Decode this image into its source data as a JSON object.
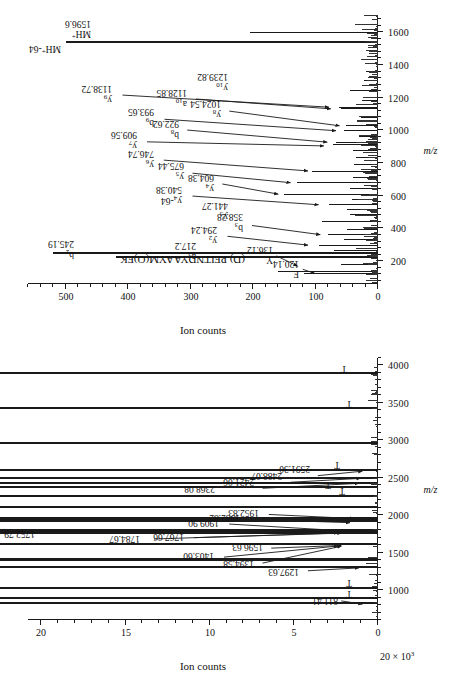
{
  "figure": {
    "orientation": "rotated-90-ccw",
    "panel_count": 2
  },
  "panel_a": {
    "title": "",
    "axes": {
      "x_title": "m/z",
      "x_ticks": [
        1000,
        1500,
        2000,
        2500,
        3000,
        3500,
        4000
      ],
      "x_min": 600,
      "x_max": 4100,
      "y_title": "Ion counts",
      "y_exponent_label": "20 × 10",
      "y_exponent_sup": "3",
      "y_ticks": [
        0,
        5,
        10,
        15,
        20
      ],
      "y_min": 0,
      "y_max": 20.8
    },
    "peak_labels": [
      {
        "text": "811.41",
        "mz": 811.41
      },
      {
        "text": "1297.63",
        "mz": 1297.63
      },
      {
        "text": "1394.58",
        "mz": 1394.58
      },
      {
        "text": "1403.60",
        "mz": 1403.6
      },
      {
        "text": "1596.63",
        "mz": 1596.63
      },
      {
        "text": "1752.79",
        "mz": 1752.79
      },
      {
        "text": "1767.66",
        "mz": 1767.66
      },
      {
        "text": "1784.67",
        "mz": 1784.67
      },
      {
        "text": "1909.90",
        "mz": 1909.9
      },
      {
        "text": "1932.82",
        "mz": 1932.82
      },
      {
        "text": "1952.83",
        "mz": 1952.83
      },
      {
        "text": "2368.08",
        "mz": 2368.08
      },
      {
        "text": "2421.06",
        "mz": 2421.06
      },
      {
        "text": "2488.07",
        "mz": 2488.07
      },
      {
        "text": "2591.30",
        "mz": 2591.3
      }
    ],
    "t_markers": [
      "T",
      "T",
      "T",
      "T",
      "T",
      "T",
      "T"
    ]
  },
  "panel_b": {
    "title": "(D) PFITNDYAAYM(O)FK",
    "axes": {
      "x_title": "m/z",
      "x_ticks": [
        200,
        400,
        600,
        800,
        1000,
        1200,
        1400,
        1600
      ],
      "x_min": 60,
      "x_max": 1700,
      "y_title": "Ion counts",
      "y_ticks": [
        0,
        100,
        200,
        300,
        400,
        500
      ],
      "y_min": 0,
      "y_max": 560
    },
    "peak_labels": [
      {
        "ion": "F",
        "sub": "",
        "value": "120.14",
        "mz": 120.14
      },
      {
        "ion": "Y",
        "sub": "",
        "value": "136.12",
        "mz": 136.12
      },
      {
        "ion": "a",
        "sub": "2",
        "value": "217.2",
        "mz": 217.2
      },
      {
        "ion": "b",
        "sub": "2",
        "value": "245.19",
        "mz": 245.19
      },
      {
        "ion": "y",
        "sub": "2",
        "value": "294.24",
        "mz": 294.24
      },
      {
        "ion": "b",
        "sub": "3",
        "value": "358.28",
        "mz": 358.28
      },
      {
        "ion": "y",
        "sub": "3",
        "value": "441.27",
        "mz": 441.27
      },
      {
        "ion": "y",
        "sub": "4",
        "suffix": "-64",
        "value": "540.38",
        "mz": 540.38
      },
      {
        "ion": "y",
        "sub": "4",
        "value": "604.38",
        "mz": 604.38
      },
      {
        "ion": "y",
        "sub": "5",
        "value": "675.44",
        "mz": 675.44
      },
      {
        "ion": "y",
        "sub": "6",
        "value": "746.74",
        "mz": 746.74
      },
      {
        "ion": "y",
        "sub": "7",
        "value": "909.56",
        "mz": 909.56
      },
      {
        "ion": "b",
        "sub": "8",
        "value": "922.62",
        "mz": 922.62
      },
      {
        "ion": "b",
        "sub": "9",
        "value": "993.65",
        "mz": 993.65
      },
      {
        "ion": "y",
        "sub": "8",
        "value": "1024.54",
        "mz": 1024.54
      },
      {
        "ion": "a",
        "sub": "10",
        "value": "1128.85",
        "mz": 1128.85
      },
      {
        "ion": "y",
        "sub": "9",
        "value": "1138.72",
        "mz": 1138.72
      },
      {
        "ion": "y",
        "sub": "10",
        "value": "1239.82",
        "mz": 1239.82
      },
      {
        "ion": "MH",
        "sup": "+",
        "suffix": "-64",
        "value": "",
        "mz": 1532.6
      },
      {
        "ion": "MH",
        "sup": "+",
        "value": "1596.6",
        "mz": 1596.6
      }
    ]
  },
  "chart_data": [
    {
      "type": "line",
      "title": "",
      "xlabel": "m/z",
      "ylabel": "Ion counts",
      "xlim": [
        600,
        4100
      ],
      "ylim": [
        0,
        20800
      ],
      "grid": false,
      "legend": "none",
      "annotations": [
        "811.41",
        "1297.63",
        "1394.58",
        "1403.60",
        "1596.63",
        "1752.79",
        "1767.66",
        "1784.67",
        "1909.90",
        "1932.82",
        "1952.83",
        "2368.08",
        "2421.06",
        "2488.07",
        "2591.30",
        "T",
        "T",
        "T",
        "T",
        "T",
        "T",
        "T"
      ],
      "x": [
        811.41,
        878,
        1016,
        1297.63,
        1394.58,
        1403.6,
        1596.63,
        1752.79,
        1767.66,
        1784.67,
        1909.9,
        1932.82,
        1952.83,
        2100,
        2240,
        2368.08,
        2421.06,
        2488.07,
        2591.3,
        2950,
        3420,
        3880
      ],
      "y": [
        640,
        520,
        380,
        420,
        900,
        1620,
        1450,
        20400,
        1800,
        1450,
        1250,
        1080,
        980,
        560,
        520,
        2700,
        720,
        640,
        600,
        350,
        420,
        500
      ]
    },
    {
      "type": "line",
      "title": "(D) PFITNDYAAYM(O)FK",
      "xlabel": "m/z",
      "ylabel": "Ion counts",
      "xlim": [
        60,
        1700
      ],
      "ylim": [
        0,
        560
      ],
      "grid": false,
      "legend": "none",
      "annotations": [
        "F 120.14",
        "Y 136.12",
        "a2 217.2",
        "b2 245.19",
        "y2 294.24",
        "b3 358.28",
        "y3 441.27",
        "y4-64 540.38",
        "y4 604.38",
        "y5 675.44",
        "y6 746.74",
        "y7 909.56",
        "b8 922.62",
        "b9 993.65",
        "y8 1024.54",
        "a10 1128.85",
        "y9 1138.72",
        "y10 1239.82",
        "MH+-64",
        "MH+ 1596.6"
      ],
      "x": [
        120.14,
        136.12,
        175,
        217.2,
        245.19,
        262,
        294.24,
        330,
        358.28,
        390,
        441.27,
        480,
        510,
        540.38,
        575,
        604.38,
        640,
        675.44,
        710,
        746.74,
        790,
        830,
        875,
        909.56,
        922.62,
        960,
        993.65,
        1024.54,
        1075,
        1128.85,
        1138.72,
        1180,
        1239.82,
        1300,
        1360,
        1430,
        1532.6,
        1596.6
      ],
      "y": [
        118,
        160,
        60,
        420,
        520,
        70,
        95,
        55,
        80,
        50,
        90,
        45,
        50,
        78,
        42,
        150,
        45,
        130,
        40,
        105,
        38,
        35,
        40,
        72,
        68,
        30,
        55,
        52,
        28,
        60,
        62,
        25,
        45,
        22,
        20,
        26,
        500,
        205
      ]
    }
  ]
}
